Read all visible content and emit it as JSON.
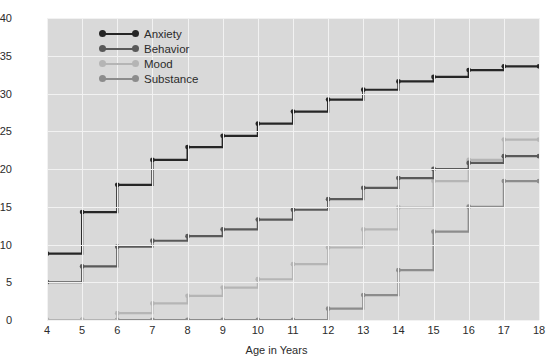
{
  "chart_data": {
    "type": "line",
    "title": "",
    "xlabel": "Age in Years",
    "ylabel": "Cumulative Percent",
    "xlim": [
      4,
      18
    ],
    "ylim": [
      0,
      40
    ],
    "x": [
      4,
      5,
      6,
      7,
      8,
      9,
      10,
      11,
      12,
      13,
      14,
      15,
      16,
      17,
      18
    ],
    "xticks": [
      "4",
      "5",
      "6",
      "7",
      "8",
      "9",
      "10",
      "11",
      "12",
      "13",
      "14",
      "15",
      "16",
      "17",
      "18"
    ],
    "yticks": [
      "0",
      "5",
      "10",
      "15",
      "20",
      "25",
      "30",
      "35",
      "40"
    ],
    "grid": true,
    "step": "post",
    "legend_position": "top-left",
    "series": [
      {
        "name": "Anxiety",
        "color": "#262626",
        "values": [
          8.8,
          14.3,
          17.9,
          21.2,
          22.9,
          24.4,
          26.0,
          27.6,
          29.2,
          30.5,
          31.6,
          32.2,
          33.1,
          33.6,
          33.6
        ]
      },
      {
        "name": "Behavior",
        "color": "#595959",
        "values": [
          5.0,
          7.1,
          9.7,
          10.5,
          11.1,
          12.0,
          13.3,
          14.6,
          16.0,
          17.5,
          18.8,
          20.0,
          20.8,
          21.7,
          21.7
        ]
      },
      {
        "name": "Mood",
        "color": "#b5b5b5",
        "values": [
          0.0,
          0.0,
          0.9,
          2.2,
          3.2,
          4.3,
          5.4,
          7.4,
          9.6,
          12.0,
          14.9,
          18.4,
          21.2,
          23.9,
          23.9
        ]
      },
      {
        "name": "Substance",
        "color": "#8c8c8c",
        "values": [
          0.0,
          0.0,
          0.0,
          0.0,
          0.0,
          0.0,
          0.0,
          0.0,
          1.5,
          3.3,
          6.6,
          11.7,
          15.0,
          18.4,
          18.4
        ]
      }
    ]
  },
  "colors": {
    "plot_background": "#d9d9d9",
    "page_background": "#ffffff",
    "gridline": "#f2f2f2",
    "text": "#2b2b2b"
  }
}
